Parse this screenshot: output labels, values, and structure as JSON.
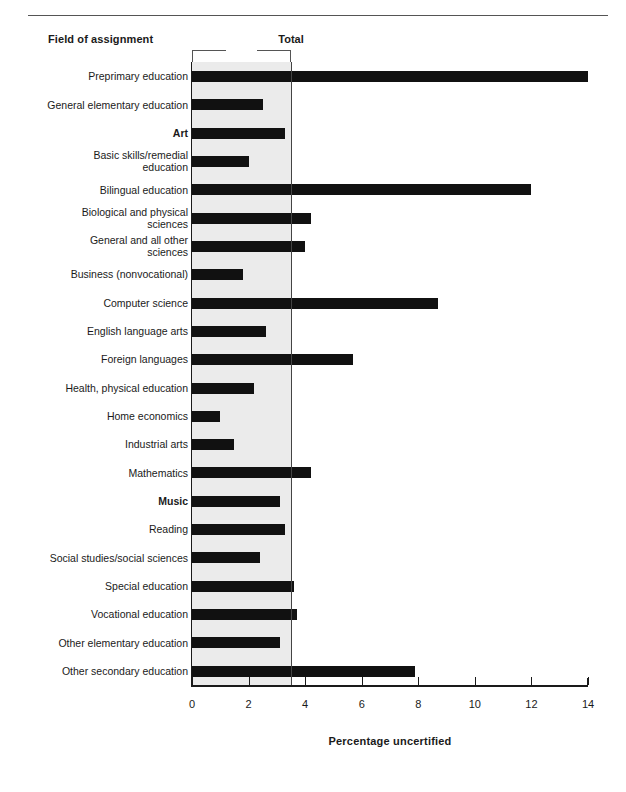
{
  "header": {
    "field_heading": "Field of assignment",
    "total_heading": "Total"
  },
  "chart_data": {
    "type": "bar",
    "orientation": "horizontal",
    "title": "",
    "xlabel": "Percentage uncertified",
    "ylabel": "Field of assignment",
    "xlim": [
      0,
      14
    ],
    "xticks": [
      0,
      2,
      4,
      6,
      8,
      10,
      12,
      14
    ],
    "xtick_labels": [
      "0",
      "2",
      "4",
      "6",
      "8",
      "10",
      "12",
      "14"
    ],
    "grid": false,
    "legend": null,
    "reference_line": {
      "label": "Total",
      "value": 3.5
    },
    "shaded_band": {
      "from": 0,
      "to": 3.5,
      "color": "#ebebeb"
    },
    "bar_color": "#111111",
    "categories": [
      "Preprimary education",
      "General elementary education",
      "Art",
      "Basic skills/remedial education",
      "Bilingual education",
      "Biological and physical sciences",
      "General and all other sciences",
      "Business (nonvocational)",
      "Computer science",
      "English language arts",
      "Foreign languages",
      "Health, physical education",
      "Home economics",
      "Industrial arts",
      "Mathematics",
      "Music",
      "Reading",
      "Social studies/social sciences",
      "Special education",
      "Vocational education",
      "Other elementary education",
      "Other secondary education"
    ],
    "values": [
      14.0,
      2.5,
      3.3,
      2.0,
      12.0,
      4.2,
      4.0,
      1.8,
      8.7,
      2.6,
      5.7,
      2.2,
      1.0,
      1.5,
      4.2,
      3.1,
      3.3,
      2.4,
      3.6,
      3.7,
      3.1,
      7.9
    ],
    "bold_categories": [
      "Art",
      "Music"
    ]
  },
  "y_axis_label_lines": [
    [
      "Preprimary education"
    ],
    [
      "General elementary education"
    ],
    [
      "Art"
    ],
    [
      "Basic skills/remedial",
      "education"
    ],
    [
      "Bilingual education"
    ],
    [
      "Biological and physical",
      "sciences"
    ],
    [
      "General and all other",
      "sciences"
    ],
    [
      "Business (nonvocational)"
    ],
    [
      "Computer science"
    ],
    [
      "English language arts"
    ],
    [
      "Foreign languages"
    ],
    [
      "Health, physical education"
    ],
    [
      "Home economics"
    ],
    [
      "Industrial arts"
    ],
    [
      "Mathematics"
    ],
    [
      "Music"
    ],
    [
      "Reading"
    ],
    [
      "Social studies/social sciences"
    ],
    [
      "Special education"
    ],
    [
      "Vocational education"
    ],
    [
      "Other elementary education"
    ],
    [
      "Other secondary education"
    ]
  ]
}
